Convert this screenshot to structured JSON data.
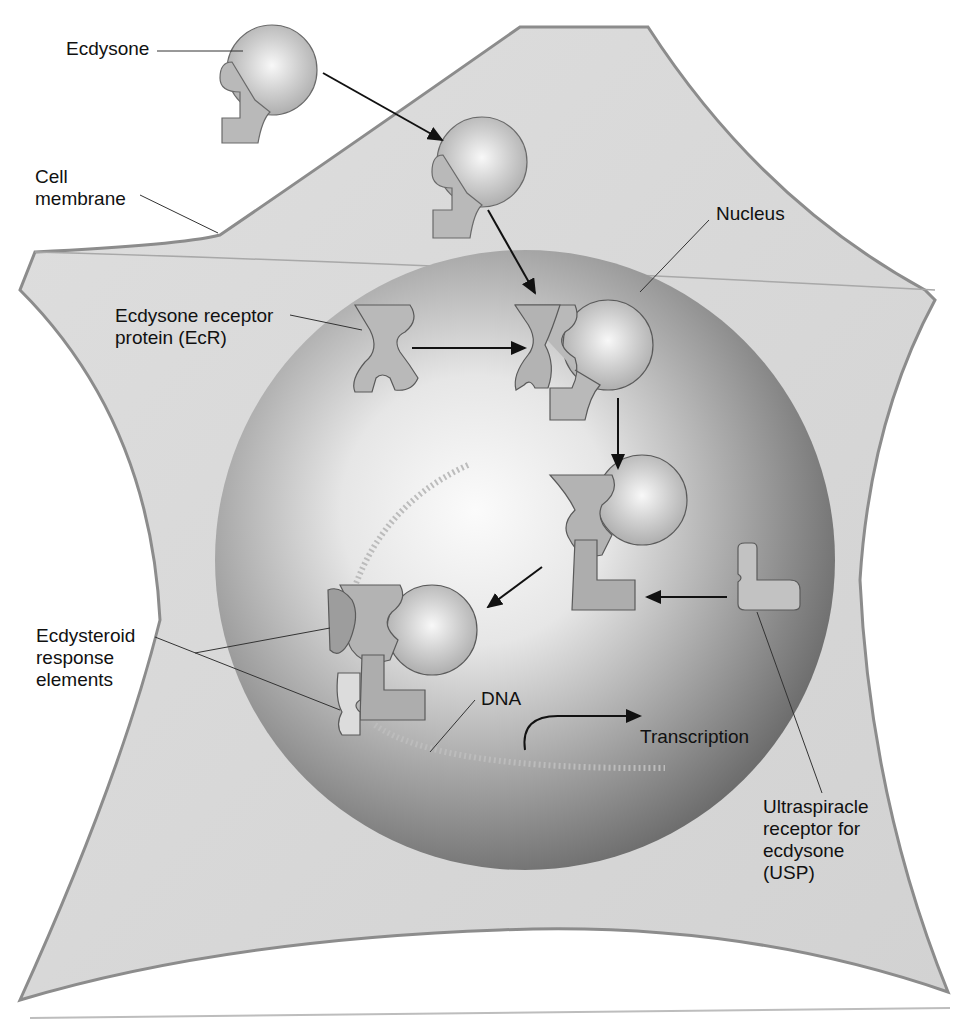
{
  "figure": {
    "colors": {
      "background": "#ffffff",
      "cytoplasm": "#d9d9d9",
      "membrane_edge": "#8c8c8c",
      "nucleus_dark": "#6e6e6e",
      "nucleus_light": "#f4f4f4",
      "protein_fill": "#b9b9b9",
      "protein_stroke": "#5a5a5a",
      "arrow": "#111111",
      "label_text": "#111111"
    }
  },
  "labels": {
    "ecdysone": "Ecdysone",
    "cell_membrane": "Cell\nmembrane",
    "nucleus": "Nucleus",
    "ecr": "Ecdysone receptor\nprotein (EcR)",
    "ere": "Ecdysteroid\nresponse\nelements",
    "dna": "DNA",
    "transcription": "Transcription",
    "usp": "Ultraspiracle\nreceptor for\necdysone\n(USP)"
  },
  "steps": [
    {
      "id": "ecdysone-outside",
      "desc": "Ecdysone hormone outside cell"
    },
    {
      "id": "ecdysone-cytoplasm",
      "desc": "Ecdysone crosses membrane into cytoplasm"
    },
    {
      "id": "ecr-binding",
      "desc": "Ecdysone binds EcR in nucleus"
    },
    {
      "id": "usp-binding",
      "desc": "USP joins EcR-ecdysone complex"
    },
    {
      "id": "dna-binding",
      "desc": "Complex binds ecdysteroid response elements on DNA"
    },
    {
      "id": "transcription",
      "desc": "Transcription is initiated"
    }
  ]
}
